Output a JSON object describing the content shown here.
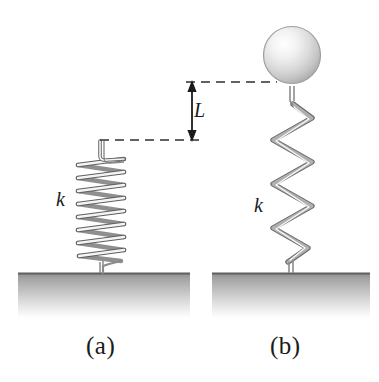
{
  "figure": {
    "background_color": "#ffffff",
    "width": 379,
    "height": 382
  },
  "colors": {
    "ink": "#1a1a1a",
    "spring_stroke": "#7d7d7d",
    "spring_shade": "#9a9a9a",
    "spring_highlight": "#ffffff",
    "wire_stroke": "#8c8c8c",
    "ground_top": "#8f8f8f",
    "ground_bottom": "#ffffff",
    "ground_edge": "#6e6e6e",
    "sphere_light": "#ffffff",
    "sphere_mid": "#e3e3e3",
    "sphere_dark": "#b5b5b5",
    "sphere_edge": "#9e9e9e",
    "dashed_line": "#3a3a3a"
  },
  "panels": [
    {
      "id": "panel-a",
      "caption": "(a)",
      "caption_x": 88,
      "caption_y": 334,
      "spring_label": "k",
      "spring_label_x": 58,
      "spring_label_y": 190,
      "state": "unloaded",
      "spring_top_y": 140,
      "spring_base_y": 272,
      "spring_center_x": 100,
      "coil_count": 10,
      "coil_half_width": 25,
      "ground": {
        "x": 18,
        "y": 272,
        "width": 172,
        "height": 46
      }
    },
    {
      "id": "panel-b",
      "caption": "(b)",
      "caption_x": 272,
      "caption_y": 334,
      "spring_label": "k",
      "spring_label_x": 256,
      "spring_label_y": 196,
      "state": "loaded",
      "spring_top_y": 88,
      "spring_base_y": 272,
      "spring_center_x": 292,
      "coil_count": 8,
      "coil_half_width": 19,
      "ball": {
        "cx": 292,
        "cy": 55,
        "r": 28
      },
      "ground": {
        "x": 212,
        "y": 272,
        "width": 158,
        "height": 46
      }
    }
  ],
  "dimension": {
    "label": "L",
    "label_x": 193,
    "label_y": 102,
    "arrow_x": 192,
    "arrow_top_y": 82,
    "arrow_bottom_y": 140,
    "upper_dash": {
      "x1": 186,
      "y1": 82,
      "x2": 276,
      "y2": 82
    },
    "lower_dash": {
      "x1": 100,
      "y1": 140,
      "x2": 198,
      "y2": 140
    }
  }
}
